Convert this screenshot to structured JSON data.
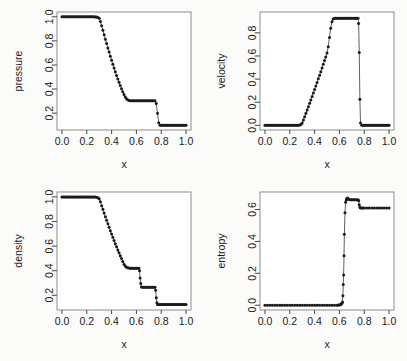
{
  "figure": {
    "layout": "2x2 panel grid",
    "background_color": "#fbfbfa",
    "panel_background": "#ffffff",
    "frame_color": "#8d8d8d",
    "marker_color": "#1b1b1b"
  },
  "chart_data": [
    {
      "type": "scatter",
      "title": "",
      "xlabel": "x",
      "ylabel": "pressure",
      "xlim": [
        -0.04,
        1.04
      ],
      "ylim": [
        0.06,
        1.04
      ],
      "xticks": [
        0.0,
        0.2,
        0.4,
        0.6,
        0.8,
        1.0
      ],
      "xtick_labels": [
        "0.0",
        "0.2",
        "0.4",
        "0.6",
        "0.8",
        "1.0"
      ],
      "yticks": [
        0.2,
        0.4,
        0.6,
        0.8,
        1.0
      ],
      "ytick_labels": [
        "0.2",
        "0.4",
        "0.6",
        "0.8",
        "1.0"
      ],
      "grid": false,
      "legend": false,
      "x": [
        0.0,
        0.01,
        0.02,
        0.03,
        0.04,
        0.05,
        0.06,
        0.07,
        0.08,
        0.09,
        0.1,
        0.11,
        0.12,
        0.13,
        0.14,
        0.15,
        0.16,
        0.17,
        0.18,
        0.19,
        0.2,
        0.21,
        0.22,
        0.23,
        0.24,
        0.25,
        0.26,
        0.27,
        0.28,
        0.29,
        0.3,
        0.31,
        0.32,
        0.33,
        0.34,
        0.35,
        0.36,
        0.37,
        0.38,
        0.39,
        0.4,
        0.41,
        0.42,
        0.43,
        0.44,
        0.45,
        0.46,
        0.47,
        0.48,
        0.49,
        0.5,
        0.51,
        0.52,
        0.53,
        0.54,
        0.55,
        0.56,
        0.57,
        0.58,
        0.59,
        0.6,
        0.61,
        0.62,
        0.63,
        0.64,
        0.65,
        0.66,
        0.67,
        0.68,
        0.69,
        0.7,
        0.71,
        0.72,
        0.73,
        0.74,
        0.75,
        0.76,
        0.77,
        0.78,
        0.79,
        0.8,
        0.81,
        0.82,
        0.83,
        0.84,
        0.85,
        0.86,
        0.87,
        0.88,
        0.89,
        0.9,
        0.91,
        0.92,
        0.93,
        0.94,
        0.95,
        0.96,
        0.97,
        0.98,
        0.99,
        1.0
      ],
      "values": [
        1.0,
        1.0,
        1.0,
        1.0,
        1.0,
        1.0,
        1.0,
        1.0,
        1.0,
        1.0,
        1.0,
        1.0,
        1.0,
        1.0,
        1.0,
        1.0,
        1.0,
        1.0,
        1.0,
        1.0,
        1.0,
        1.0,
        1.0,
        1.0,
        1.0,
        1.0,
        1.0,
        0.999,
        0.998,
        0.995,
        0.988,
        0.962,
        0.925,
        0.888,
        0.851,
        0.814,
        0.778,
        0.742,
        0.707,
        0.672,
        0.639,
        0.606,
        0.574,
        0.543,
        0.513,
        0.484,
        0.456,
        0.429,
        0.403,
        0.378,
        0.354,
        0.334,
        0.32,
        0.311,
        0.305,
        0.303,
        0.303,
        0.303,
        0.303,
        0.303,
        0.303,
        0.303,
        0.303,
        0.303,
        0.303,
        0.303,
        0.303,
        0.303,
        0.303,
        0.303,
        0.303,
        0.303,
        0.303,
        0.303,
        0.303,
        0.303,
        0.281,
        0.2,
        0.12,
        0.1,
        0.1,
        0.1,
        0.1,
        0.1,
        0.1,
        0.1,
        0.1,
        0.1,
        0.1,
        0.1,
        0.1,
        0.1,
        0.1,
        0.1,
        0.1,
        0.1,
        0.1,
        0.1,
        0.1,
        0.1,
        0.1
      ]
    },
    {
      "type": "scatter",
      "title": "",
      "xlabel": "x",
      "ylabel": "velocity",
      "xlim": [
        -0.04,
        1.04
      ],
      "ylim": [
        -0.04,
        0.98
      ],
      "xticks": [
        0.0,
        0.2,
        0.4,
        0.6,
        0.8,
        1.0
      ],
      "xtick_labels": [
        "0.0",
        "0.2",
        "0.4",
        "0.6",
        "0.8",
        "1.0"
      ],
      "yticks": [
        0.0,
        0.2,
        0.4,
        0.6,
        0.8
      ],
      "ytick_labels": [
        "0.0",
        "0.2",
        "0.4",
        "0.6",
        "0.8"
      ],
      "grid": false,
      "legend": false,
      "x": [
        0.0,
        0.01,
        0.02,
        0.03,
        0.04,
        0.05,
        0.06,
        0.07,
        0.08,
        0.09,
        0.1,
        0.11,
        0.12,
        0.13,
        0.14,
        0.15,
        0.16,
        0.17,
        0.18,
        0.19,
        0.2,
        0.21,
        0.22,
        0.23,
        0.24,
        0.25,
        0.26,
        0.27,
        0.28,
        0.29,
        0.3,
        0.31,
        0.32,
        0.33,
        0.34,
        0.35,
        0.36,
        0.37,
        0.38,
        0.39,
        0.4,
        0.41,
        0.42,
        0.43,
        0.44,
        0.45,
        0.46,
        0.47,
        0.48,
        0.49,
        0.5,
        0.51,
        0.52,
        0.53,
        0.54,
        0.55,
        0.56,
        0.57,
        0.58,
        0.59,
        0.6,
        0.61,
        0.62,
        0.63,
        0.64,
        0.65,
        0.66,
        0.67,
        0.68,
        0.69,
        0.7,
        0.71,
        0.72,
        0.73,
        0.74,
        0.75,
        0.755,
        0.76,
        0.765,
        0.77,
        0.78,
        0.79,
        0.8,
        0.81,
        0.82,
        0.83,
        0.84,
        0.85,
        0.86,
        0.87,
        0.88,
        0.89,
        0.9,
        0.91,
        0.92,
        0.93,
        0.94,
        0.95,
        0.96,
        0.97,
        0.98,
        0.99,
        1.0
      ],
      "values": [
        0.0,
        0.0,
        0.0,
        0.0,
        0.0,
        0.0,
        0.0,
        0.0,
        0.0,
        0.0,
        0.0,
        0.0,
        0.0,
        0.0,
        0.0,
        0.0,
        0.0,
        0.0,
        0.0,
        0.0,
        0.0,
        0.0,
        0.0,
        0.0,
        0.0,
        0.0,
        0.0,
        0.001,
        0.003,
        0.008,
        0.02,
        0.047,
        0.075,
        0.104,
        0.133,
        0.162,
        0.191,
        0.22,
        0.25,
        0.28,
        0.31,
        0.34,
        0.371,
        0.402,
        0.433,
        0.464,
        0.496,
        0.528,
        0.56,
        0.592,
        0.625,
        0.68,
        0.76,
        0.84,
        0.895,
        0.92,
        0.927,
        0.927,
        0.927,
        0.927,
        0.927,
        0.927,
        0.927,
        0.927,
        0.927,
        0.927,
        0.927,
        0.927,
        0.927,
        0.927,
        0.927,
        0.927,
        0.927,
        0.927,
        0.927,
        0.927,
        0.88,
        0.63,
        0.225,
        0.02,
        0.0,
        0.0,
        0.0,
        0.0,
        0.0,
        0.0,
        0.0,
        0.0,
        0.0,
        0.0,
        0.0,
        0.0,
        0.0,
        0.0,
        0.0,
        0.0,
        0.0,
        0.0,
        0.0,
        0.0,
        0.0,
        0.0,
        0.0
      ]
    },
    {
      "type": "scatter",
      "title": "",
      "xlabel": "x",
      "ylabel": "density",
      "xlim": [
        -0.04,
        1.04
      ],
      "ylim": [
        0.08,
        1.04
      ],
      "xticks": [
        0.0,
        0.2,
        0.4,
        0.6,
        0.8,
        1.0
      ],
      "xtick_labels": [
        "0.0",
        "0.2",
        "0.4",
        "0.6",
        "0.8",
        "1.0"
      ],
      "yticks": [
        0.2,
        0.4,
        0.6,
        0.8,
        1.0
      ],
      "ytick_labels": [
        "0.2",
        "0.4",
        "0.6",
        "0.8",
        "1.0"
      ],
      "grid": false,
      "legend": false,
      "x": [
        0.0,
        0.01,
        0.02,
        0.03,
        0.04,
        0.05,
        0.06,
        0.07,
        0.08,
        0.09,
        0.1,
        0.11,
        0.12,
        0.13,
        0.14,
        0.15,
        0.16,
        0.17,
        0.18,
        0.19,
        0.2,
        0.21,
        0.22,
        0.23,
        0.24,
        0.25,
        0.26,
        0.27,
        0.28,
        0.29,
        0.3,
        0.31,
        0.32,
        0.33,
        0.34,
        0.35,
        0.36,
        0.37,
        0.38,
        0.39,
        0.4,
        0.41,
        0.42,
        0.43,
        0.44,
        0.45,
        0.46,
        0.47,
        0.48,
        0.49,
        0.5,
        0.51,
        0.52,
        0.53,
        0.54,
        0.55,
        0.56,
        0.57,
        0.58,
        0.59,
        0.6,
        0.61,
        0.62,
        0.625,
        0.63,
        0.635,
        0.64,
        0.65,
        0.66,
        0.67,
        0.68,
        0.69,
        0.7,
        0.71,
        0.72,
        0.73,
        0.74,
        0.75,
        0.755,
        0.76,
        0.765,
        0.77,
        0.78,
        0.79,
        0.8,
        0.81,
        0.82,
        0.83,
        0.84,
        0.85,
        0.86,
        0.87,
        0.88,
        0.89,
        0.9,
        0.91,
        0.92,
        0.93,
        0.94,
        0.95,
        0.96,
        0.97,
        0.98,
        0.99,
        1.0
      ],
      "values": [
        1.0,
        1.0,
        1.0,
        1.0,
        1.0,
        1.0,
        1.0,
        1.0,
        1.0,
        1.0,
        1.0,
        1.0,
        1.0,
        1.0,
        1.0,
        1.0,
        1.0,
        1.0,
        1.0,
        1.0,
        1.0,
        1.0,
        1.0,
        1.0,
        1.0,
        1.0,
        1.0,
        0.999,
        0.997,
        0.993,
        0.985,
        0.96,
        0.929,
        0.899,
        0.869,
        0.839,
        0.81,
        0.781,
        0.753,
        0.725,
        0.698,
        0.671,
        0.645,
        0.619,
        0.594,
        0.569,
        0.545,
        0.521,
        0.498,
        0.475,
        0.453,
        0.437,
        0.427,
        0.423,
        0.421,
        0.42,
        0.42,
        0.42,
        0.42,
        0.42,
        0.42,
        0.42,
        0.419,
        0.4,
        0.34,
        0.295,
        0.268,
        0.265,
        0.265,
        0.265,
        0.265,
        0.265,
        0.265,
        0.265,
        0.265,
        0.265,
        0.265,
        0.265,
        0.24,
        0.18,
        0.14,
        0.125,
        0.125,
        0.125,
        0.125,
        0.125,
        0.125,
        0.125,
        0.125,
        0.125,
        0.125,
        0.125,
        0.125,
        0.125,
        0.125,
        0.125,
        0.125,
        0.125,
        0.125,
        0.125,
        0.125,
        0.125,
        0.125,
        0.125,
        0.125
      ]
    },
    {
      "type": "scatter",
      "title": "",
      "xlabel": "x",
      "ylabel": "entropy",
      "xlim": [
        -0.04,
        1.04
      ],
      "ylim": [
        -0.03,
        0.71
      ],
      "xticks": [
        0.0,
        0.2,
        0.4,
        0.6,
        0.8,
        1.0
      ],
      "xtick_labels": [
        "0.0",
        "0.2",
        "0.4",
        "0.6",
        "0.8",
        "1.0"
      ],
      "yticks": [
        0.0,
        0.2,
        0.4,
        0.6
      ],
      "ytick_labels": [
        "0.0",
        "0.2",
        "0.4",
        "0.6"
      ],
      "grid": false,
      "legend": false,
      "x": [
        0.0,
        0.02,
        0.04,
        0.06,
        0.08,
        0.1,
        0.12,
        0.14,
        0.16,
        0.18,
        0.2,
        0.22,
        0.24,
        0.26,
        0.28,
        0.3,
        0.32,
        0.34,
        0.36,
        0.38,
        0.4,
        0.42,
        0.44,
        0.46,
        0.48,
        0.5,
        0.52,
        0.54,
        0.56,
        0.58,
        0.59,
        0.6,
        0.605,
        0.61,
        0.615,
        0.62,
        0.625,
        0.628,
        0.631,
        0.634,
        0.637,
        0.64,
        0.645,
        0.65,
        0.655,
        0.66,
        0.665,
        0.67,
        0.675,
        0.68,
        0.69,
        0.7,
        0.71,
        0.72,
        0.73,
        0.74,
        0.75,
        0.755,
        0.76,
        0.765,
        0.77,
        0.78,
        0.79,
        0.8,
        0.82,
        0.84,
        0.86,
        0.88,
        0.9,
        0.92,
        0.94,
        0.96,
        0.98,
        1.0
      ],
      "values": [
        0.0,
        0.0,
        0.0,
        0.0,
        0.0,
        0.0,
        0.0,
        0.0,
        0.0,
        0.0,
        0.0,
        0.0,
        0.0,
        0.0,
        0.0,
        0.0,
        0.0,
        0.0,
        0.0,
        0.0,
        0.0,
        0.0,
        0.0,
        0.0,
        0.0,
        0.0,
        0.0,
        0.0,
        0.0,
        0.0,
        0.001,
        0.002,
        0.003,
        0.005,
        0.008,
        0.012,
        0.02,
        0.06,
        0.13,
        0.19,
        0.31,
        0.445,
        0.58,
        0.645,
        0.66,
        0.67,
        0.672,
        0.668,
        0.665,
        0.663,
        0.662,
        0.662,
        0.662,
        0.662,
        0.662,
        0.662,
        0.662,
        0.655,
        0.63,
        0.615,
        0.61,
        0.61,
        0.61,
        0.61,
        0.61,
        0.61,
        0.61,
        0.61,
        0.61,
        0.61,
        0.61,
        0.61,
        0.61,
        0.61
      ]
    }
  ]
}
